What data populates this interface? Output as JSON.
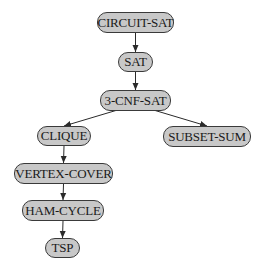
{
  "diagram": {
    "type": "reduction-tree",
    "nodes": [
      {
        "id": "circuit_sat",
        "label": "CIRCUIT-SAT",
        "x": 97,
        "y": 12,
        "w": 77,
        "h": 21
      },
      {
        "id": "sat",
        "label": "SAT",
        "x": 118,
        "y": 52,
        "w": 35,
        "h": 20
      },
      {
        "id": "cnf3_sat",
        "label": "3-CNF-SAT",
        "x": 100,
        "y": 90,
        "w": 71,
        "h": 21
      },
      {
        "id": "clique",
        "label": "CLIQUE",
        "x": 37,
        "y": 126,
        "w": 54,
        "h": 20
      },
      {
        "id": "subset_sum",
        "label": "SUBSET-SUM",
        "x": 163,
        "y": 126,
        "w": 88,
        "h": 21
      },
      {
        "id": "vertex_cover",
        "label": "VERTEX-COVER",
        "x": 14,
        "y": 163,
        "w": 99,
        "h": 21
      },
      {
        "id": "ham_cycle",
        "label": "HAM-CYCLE",
        "x": 22,
        "y": 200,
        "w": 82,
        "h": 21
      },
      {
        "id": "tsp",
        "label": "TSP",
        "x": 45,
        "y": 238,
        "w": 35,
        "h": 20
      }
    ],
    "edges": [
      {
        "from": "circuit_sat",
        "to": "sat"
      },
      {
        "from": "sat",
        "to": "cnf3_sat"
      },
      {
        "from": "cnf3_sat",
        "to": "clique"
      },
      {
        "from": "cnf3_sat",
        "to": "subset_sum"
      },
      {
        "from": "clique",
        "to": "vertex_cover"
      },
      {
        "from": "vertex_cover",
        "to": "ham_cycle"
      },
      {
        "from": "ham_cycle",
        "to": "tsp"
      }
    ],
    "colors": {
      "node_fill": "#c8c8c8",
      "node_border": "#3a3a3a",
      "edge": "#2a2a2a",
      "text": "#1a1a1a"
    }
  }
}
